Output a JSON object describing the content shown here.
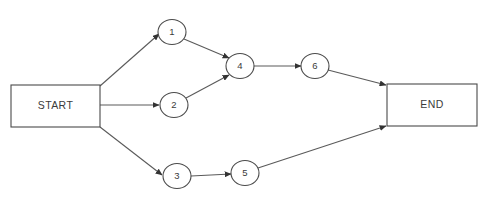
{
  "diagram": {
    "type": "directed-graph",
    "title": "",
    "background_color": "#ffffff",
    "stroke_color": "#4a4a4a",
    "edge_color": "#5a5a5a",
    "text_color": "#3b3b3b",
    "terminals": [
      {
        "id": "start",
        "label": "START",
        "shape": "rectangle",
        "x": 11,
        "y": 85,
        "width": 89,
        "height": 42
      },
      {
        "id": "end",
        "label": "END",
        "shape": "rectangle",
        "x": 387,
        "y": 84,
        "width": 90,
        "height": 42
      }
    ],
    "nodes": [
      {
        "id": "n1",
        "label": "1",
        "shape": "ellipse",
        "cx": 172,
        "cy": 32,
        "rx": 14,
        "ry": 12.5
      },
      {
        "id": "n2",
        "label": "2",
        "shape": "ellipse",
        "cx": 174,
        "cy": 105,
        "rx": 14,
        "ry": 12.5
      },
      {
        "id": "n3",
        "label": "3",
        "shape": "ellipse",
        "cx": 177,
        "cy": 176,
        "rx": 14,
        "ry": 12.5
      },
      {
        "id": "n4",
        "label": "4",
        "shape": "ellipse",
        "cx": 240,
        "cy": 66,
        "rx": 14,
        "ry": 12.5
      },
      {
        "id": "n5",
        "label": "5",
        "shape": "ellipse",
        "cx": 245,
        "cy": 173,
        "rx": 14,
        "ry": 12.5
      },
      {
        "id": "n6",
        "label": "6",
        "shape": "ellipse",
        "cx": 315,
        "cy": 66,
        "rx": 14,
        "ry": 12.5
      }
    ],
    "edges": [
      {
        "id": "e-start-1",
        "from": "start",
        "to": "n1",
        "x1": 100,
        "y1": 86,
        "x2": 159,
        "y2": 34,
        "arrow": true
      },
      {
        "id": "e-start-2",
        "from": "start",
        "to": "n2",
        "x1": 100,
        "y1": 105,
        "x2": 159,
        "y2": 105,
        "arrow": true
      },
      {
        "id": "e-start-3",
        "from": "start",
        "to": "n3",
        "x1": 100,
        "y1": 127,
        "x2": 162,
        "y2": 175,
        "arrow": true
      },
      {
        "id": "e-1-4",
        "from": "n1",
        "to": "n4",
        "x1": 184,
        "y1": 39,
        "x2": 229,
        "y2": 58,
        "arrow": true
      },
      {
        "id": "e-2-4",
        "from": "n2",
        "to": "n4",
        "x1": 186,
        "y1": 98,
        "x2": 229,
        "y2": 75,
        "arrow": true
      },
      {
        "id": "e-3-5",
        "from": "n3",
        "to": "n5",
        "x1": 191,
        "y1": 176,
        "x2": 231,
        "y2": 174,
        "arrow": true
      },
      {
        "id": "e-4-6",
        "from": "n4",
        "to": "n6",
        "x1": 254,
        "y1": 66,
        "x2": 301,
        "y2": 66,
        "arrow": true
      },
      {
        "id": "e-6-end",
        "from": "n6",
        "to": "end",
        "x1": 328,
        "y1": 70,
        "x2": 386,
        "y2": 85,
        "arrow": true
      },
      {
        "id": "e-5-end",
        "from": "n5",
        "to": "end",
        "x1": 258,
        "y1": 168,
        "x2": 386,
        "y2": 126,
        "arrow": true
      }
    ]
  }
}
